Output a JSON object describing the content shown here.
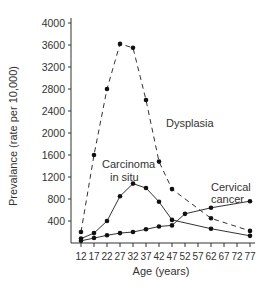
{
  "chart_data": {
    "type": "line",
    "title": "",
    "xlabel": "Age (years)",
    "ylabel": "Prevalance (rate per 10,000)",
    "x": [
      12,
      17,
      22,
      27,
      32,
      37,
      42,
      47,
      52,
      57,
      62,
      67,
      72,
      77
    ],
    "x_ticks": [
      "12",
      "17",
      "22",
      "27",
      "32",
      "37",
      "42",
      "47",
      "52",
      "57",
      "62",
      "67",
      "72",
      "77"
    ],
    "y_ticks": [
      "400",
      "800",
      "1200",
      "1600",
      "2000",
      "2400",
      "2800",
      "3200",
      "3600",
      "4000"
    ],
    "ylim": [
      0,
      4000
    ],
    "grid": false,
    "series": [
      {
        "name": "Dysplasia",
        "style": "dashed",
        "x": [
          12,
          17,
          22,
          27,
          32,
          37,
          42,
          47,
          62,
          77
        ],
        "values": [
          200,
          1600,
          2800,
          3620,
          3550,
          2600,
          1480,
          980,
          450,
          220
        ]
      },
      {
        "name": "Carcinoma in situ",
        "style": "solid",
        "x": [
          12,
          17,
          22,
          27,
          32,
          37,
          42,
          47,
          62,
          77
        ],
        "values": [
          80,
          180,
          400,
          850,
          1080,
          1000,
          750,
          420,
          260,
          130
        ]
      },
      {
        "name": "Cervical cancer",
        "style": "solid",
        "x": [
          12,
          17,
          22,
          27,
          32,
          37,
          42,
          47,
          52,
          62,
          77
        ],
        "values": [
          40,
          90,
          140,
          180,
          200,
          250,
          300,
          320,
          530,
          640,
          760
        ]
      }
    ],
    "annotations": [
      {
        "text": "Dysplasia"
      },
      {
        "text_lines": [
          "Carcinoma",
          "in situ"
        ]
      },
      {
        "text_lines": [
          "Cervical",
          "cancer"
        ]
      }
    ]
  }
}
